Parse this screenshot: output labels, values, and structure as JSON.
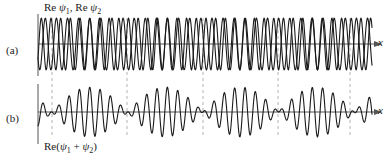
{
  "figure": {
    "title_top": "Re ψ₁, Re ψ₂",
    "title_bottom": "Re(ψ₁ + ψ₂)",
    "panel_a_label": "(a)",
    "panel_b_label": "(b)",
    "x_axis_label_a": "x",
    "x_axis_label_b": "x",
    "curve_color": "#1a1a1a",
    "axis_color": "#555555",
    "guide_color": "#b4b4b4"
  },
  "chart_data": {
    "type": "line",
    "xlabel": "x",
    "ylabel": "",
    "grid": false,
    "legend": "none",
    "panels": [
      {
        "id": "a",
        "label": "(a)",
        "axis_label_text": "Re ψ₁, Re ψ₂",
        "xlim": [
          0,
          100
        ],
        "ylim": [
          -1,
          1
        ],
        "series": [
          {
            "name": "Re ψ₁",
            "form": "cos",
            "amplitude": 1.0,
            "wavenumber": 2.18,
            "phase": 0.0
          },
          {
            "name": "Re ψ₂",
            "form": "cos",
            "amplitude": 1.0,
            "wavenumber": 2.45,
            "phase": 0.0
          }
        ]
      },
      {
        "id": "b",
        "label": "(b)",
        "axis_label_text": "Re(ψ₁ + ψ₂)",
        "xlim": [
          0,
          100
        ],
        "ylim": [
          -2,
          2
        ],
        "series": [
          {
            "name": "Re(ψ₁ + ψ₂)",
            "form": "sum-of-cos-beat",
            "amplitude": 2.0,
            "carrier_wavenumber": 2.315,
            "envelope_wavenumber": 0.135,
            "beat_period_px": 75.5
          }
        ]
      }
    ],
    "node_guides_x_px": [
      52,
      127,
      203,
      278,
      350
    ],
    "annotations": [
      {
        "text": "Re ψ₁, Re ψ₂",
        "x_px": 44,
        "y_px": 10
      },
      {
        "text": "Re(ψ₁ + ψ₂)",
        "x_px": 44,
        "y_px": 148
      }
    ]
  }
}
